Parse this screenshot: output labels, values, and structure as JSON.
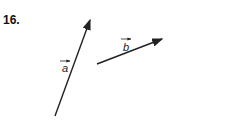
{
  "problem_number": "16.",
  "vectors": [
    {
      "name": "a",
      "label": "a",
      "tail": [
        55,
        116
      ],
      "head": [
        90,
        20
      ]
    },
    {
      "name": "b",
      "label": "b",
      "tail": [
        97,
        64
      ],
      "head": [
        162,
        39
      ]
    }
  ],
  "colors": {
    "stroke": "#222222"
  }
}
